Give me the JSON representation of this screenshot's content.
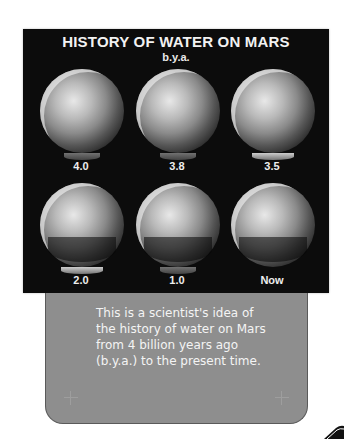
{
  "figure": {
    "title": "HISTORY OF WATER ON MARS",
    "subtitle": "b.y.a.",
    "panels": [
      {
        "label": "4.0"
      },
      {
        "label": "3.8"
      },
      {
        "label": "3.5"
      },
      {
        "label": "2.0"
      },
      {
        "label": "1.0"
      },
      {
        "label": "Now"
      }
    ]
  },
  "caption": {
    "text": "This is a scientist's idea of the history of water on Mars from 4 billion years ago (b.y.a.) to the present time."
  },
  "colors": {
    "panel_background": "#0c0c0c",
    "caption_background": "#8e8e8e",
    "caption_text": "#f4f4f4"
  }
}
